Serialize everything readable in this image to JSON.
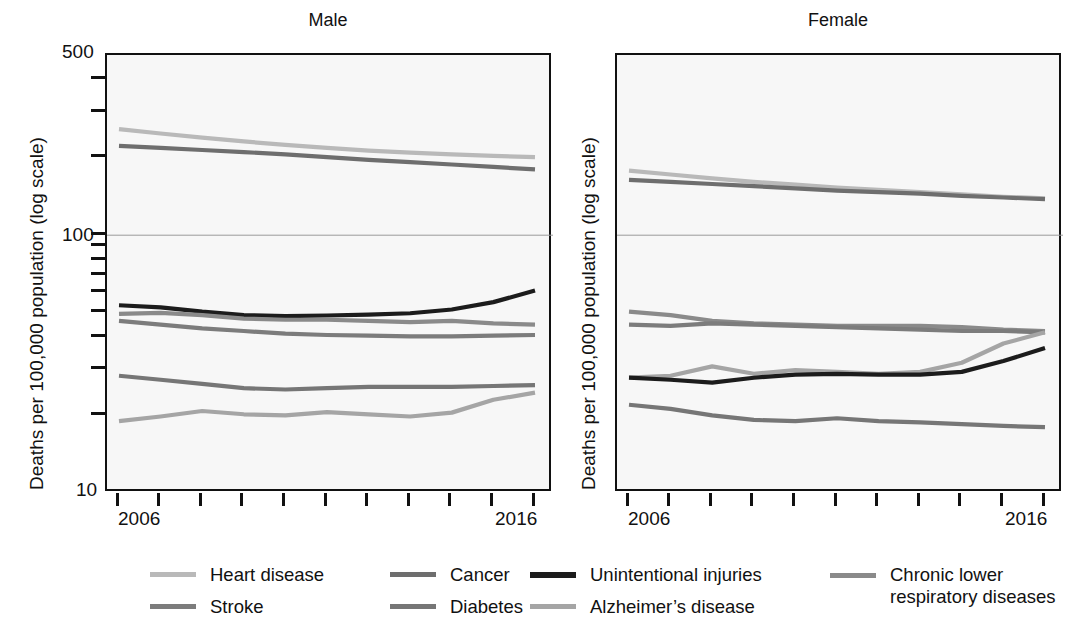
{
  "chart_data": {
    "type": "line",
    "title": "",
    "ylabel": "Deaths per 100,000 population (log scale)",
    "xlabel": "",
    "yscale": "log",
    "ylim": [
      10,
      500
    ],
    "ytick_labels": [
      "500",
      "100",
      "10"
    ],
    "ytick_values": [
      500,
      100,
      10
    ],
    "grid": "horizontal gridline at 100 only",
    "legend_position": "bottom",
    "x": [
      2006,
      2007,
      2008,
      2009,
      2010,
      2011,
      2012,
      2013,
      2014,
      2015,
      2016
    ],
    "xtick_labels": [
      "2006",
      "2016"
    ],
    "xtick_values": [
      2006,
      2016
    ],
    "panels": [
      {
        "name": "Male",
        "series": [
          {
            "name": "Heart disease",
            "color": "#b9b9b9",
            "values": [
              258,
              248,
              239,
              231,
              224,
              218,
              213,
              209,
              206,
              203,
              201
            ]
          },
          {
            "name": "Cancer",
            "color": "#6e6e6e",
            "values": [
              222,
              218,
              214,
              210,
              206,
              201,
              196,
              192,
              188,
              184,
              180
            ]
          },
          {
            "name": "Unintentional injuries",
            "color": "#1c1c1c",
            "values": [
              53.5,
              52.5,
              50.5,
              49.0,
              48.5,
              48.8,
              49.2,
              49.8,
              51.5,
              55.0,
              61.0
            ]
          },
          {
            "name": "Chronic lower respiratory diseases",
            "color": "#8a8a8a",
            "values": [
              49.5,
              50.0,
              49.0,
              47.5,
              47.0,
              47.0,
              46.5,
              46.0,
              46.5,
              45.5,
              45.0
            ]
          },
          {
            "name": "Stroke",
            "color": "#7c7c7c",
            "values": [
              46.5,
              45.0,
              43.5,
              42.5,
              41.5,
              41.0,
              40.8,
              40.5,
              40.5,
              40.8,
              41.0
            ]
          },
          {
            "name": "Diabetes",
            "color": "#767676",
            "values": [
              28.5,
              27.5,
              26.5,
              25.5,
              25.2,
              25.5,
              25.8,
              25.8,
              25.8,
              26.0,
              26.2
            ]
          },
          {
            "name": "Alzheimer's disease",
            "color": "#a5a5a5",
            "values": [
              19.0,
              19.8,
              20.8,
              20.2,
              20.0,
              20.6,
              20.2,
              19.8,
              20.5,
              23.0,
              24.5
            ]
          }
        ]
      },
      {
        "name": "Female",
        "series": [
          {
            "name": "Heart disease",
            "color": "#b9b9b9",
            "values": [
              178,
              172,
              166,
              161,
              157,
              153,
              150,
              147,
              144,
              141,
              139
            ]
          },
          {
            "name": "Cancer",
            "color": "#6e6e6e",
            "values": [
              164,
              161,
              158,
              155,
              152,
              149,
              147,
              145,
              142,
              140,
              138
            ]
          },
          {
            "name": "Chronic lower respiratory diseases",
            "color": "#8a8a8a",
            "values": [
              50.5,
              49.0,
              46.5,
              45.5,
              45.0,
              44.5,
              44.5,
              44.5,
              44.0,
              43.0,
              42.5
            ]
          },
          {
            "name": "Stroke",
            "color": "#7c7c7c",
            "values": [
              45.0,
              44.5,
              45.5,
              45.0,
              44.5,
              44.0,
              43.5,
              43.0,
              42.5,
              42.5,
              42.0
            ]
          },
          {
            "name": "Alzheimer's disease",
            "color": "#a5a5a5",
            "values": [
              28.0,
              28.5,
              31.0,
              29.0,
              30.0,
              29.5,
              29.0,
              29.5,
              32.0,
              38.0,
              42.0
            ]
          },
          {
            "name": "Unintentional injuries",
            "color": "#1c1c1c",
            "values": [
              28.0,
              27.5,
              26.8,
              28.0,
              28.8,
              29.0,
              28.8,
              28.8,
              29.5,
              32.5,
              36.5
            ]
          },
          {
            "name": "Diabetes",
            "color": "#767676",
            "values": [
              22.0,
              21.2,
              20.0,
              19.2,
              19.0,
              19.5,
              19.0,
              18.8,
              18.5,
              18.2,
              18.0
            ]
          }
        ]
      }
    ],
    "legend": [
      {
        "label": "Heart disease",
        "label_line2": "",
        "color": "#b9b9b9"
      },
      {
        "label": "Cancer",
        "label_line2": "",
        "color": "#6e6e6e"
      },
      {
        "label": "Unintentional injuries",
        "label_line2": "",
        "color": "#1c1c1c"
      },
      {
        "label": "Chronic lower",
        "label_line2": "respiratory diseases",
        "color": "#8a8a8a"
      },
      {
        "label": "Stroke",
        "label_line2": "",
        "color": "#7c7c7c"
      },
      {
        "label": "Diabetes",
        "label_line2": "",
        "color": "#767676"
      },
      {
        "label": "Alzheimer’s disease",
        "label_line2": "",
        "color": "#a5a5a5"
      }
    ]
  },
  "panels": {
    "male": {
      "title": "Male"
    },
    "female": {
      "title": "Female"
    }
  },
  "axis": {
    "ylabel_left": "Deaths per 100,000 population (log scale)",
    "ylabel_right": "Deaths per 100,000 population (log scale)",
    "ytop": "500",
    "ymid": "100",
    "ybottom": "10",
    "xstart_left": "2006",
    "xend_left": "2016",
    "xstart_right": "2006",
    "xend_right": "2016"
  },
  "legend": {
    "heart_disease": "Heart disease",
    "cancer": "Cancer",
    "unintentional_injuries": "Unintentional injuries",
    "chronic_lower_1": "Chronic lower",
    "chronic_lower_2": "respiratory diseases",
    "stroke": "Stroke",
    "diabetes": "Diabetes",
    "alzheimers": "Alzheimer’s disease"
  }
}
